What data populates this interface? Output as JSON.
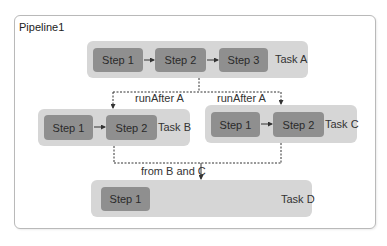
{
  "pipeline": {
    "title": "Pipeline1",
    "tasks": [
      {
        "name": "Task A",
        "steps": [
          "Step 1",
          "Step 2",
          "Step 3"
        ]
      },
      {
        "name": "Task B",
        "steps": [
          "Step 1",
          "Step 2"
        ]
      },
      {
        "name": "Task C",
        "steps": [
          "Step 1",
          "Step 2"
        ]
      },
      {
        "name": "Task D",
        "steps": [
          "Step 1"
        ]
      }
    ],
    "edges": [
      {
        "from": "Task A",
        "to": "Task B",
        "label": "runAfter A"
      },
      {
        "from": "Task A",
        "to": "Task C",
        "label": "runAfter A"
      },
      {
        "from": "Task B and Task C",
        "to": "Task D",
        "label": "from B and C"
      }
    ]
  },
  "colors": {
    "task_bg": "#d6d6d6",
    "step_bg": "#8f8f8f",
    "border": "#b9b9b9",
    "connector": "#333333"
  }
}
